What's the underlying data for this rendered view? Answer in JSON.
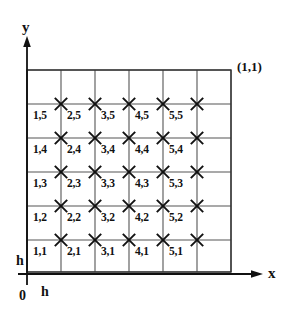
{
  "figure": {
    "title_visible": false,
    "background": "#ffffff",
    "ink_color": "#111111",
    "grid_line_color": "#555555",
    "axes": {
      "x_label": "x",
      "y_label": "y",
      "origin_label": "0"
    },
    "annotations": {
      "top_right_corner": "(1,1)",
      "step_left": "h",
      "step_bottom": "h"
    },
    "geometry": {
      "grid_left": 27,
      "grid_top": 70,
      "grid_right": 231,
      "grid_bottom": 272,
      "cell": 34,
      "vertical_lines_x": [
        27,
        61,
        95,
        129,
        163,
        197,
        231
      ],
      "horizontal_lines_y": [
        70,
        104,
        138,
        172,
        206,
        240,
        272
      ],
      "x_axis_y": 274,
      "y_axis_x": 27,
      "x_axis_end": 262,
      "y_axis_top": 42,
      "y_axis_bottom": 285
    },
    "nodes": {
      "marker_glyph": "cross-marker",
      "marker_x": [
        61,
        95,
        129,
        163,
        197
      ],
      "marker_y": [
        104,
        138,
        172,
        206,
        240
      ],
      "labels": [
        {
          "text": "1,5",
          "x": 33,
          "y": 110,
          "i": 1,
          "j": 5
        },
        {
          "text": "2,5",
          "x": 67,
          "y": 110,
          "i": 2,
          "j": 5
        },
        {
          "text": "3,5",
          "x": 101,
          "y": 110,
          "i": 3,
          "j": 5
        },
        {
          "text": "4,5",
          "x": 135,
          "y": 110,
          "i": 4,
          "j": 5
        },
        {
          "text": "5,5",
          "x": 169,
          "y": 110,
          "i": 5,
          "j": 5
        },
        {
          "text": "1,4",
          "x": 33,
          "y": 144,
          "i": 1,
          "j": 4
        },
        {
          "text": "2,4",
          "x": 67,
          "y": 144,
          "i": 2,
          "j": 4
        },
        {
          "text": "3,4",
          "x": 101,
          "y": 144,
          "i": 3,
          "j": 4
        },
        {
          "text": "4,4",
          "x": 135,
          "y": 144,
          "i": 4,
          "j": 4
        },
        {
          "text": "5,4",
          "x": 169,
          "y": 144,
          "i": 5,
          "j": 4
        },
        {
          "text": "1,3",
          "x": 33,
          "y": 178,
          "i": 1,
          "j": 3
        },
        {
          "text": "2,3",
          "x": 67,
          "y": 178,
          "i": 2,
          "j": 3
        },
        {
          "text": "3,3",
          "x": 101,
          "y": 178,
          "i": 3,
          "j": 3
        },
        {
          "text": "4,3",
          "x": 135,
          "y": 178,
          "i": 4,
          "j": 3
        },
        {
          "text": "5,3",
          "x": 169,
          "y": 178,
          "i": 5,
          "j": 3
        },
        {
          "text": "1,2",
          "x": 33,
          "y": 212,
          "i": 1,
          "j": 2
        },
        {
          "text": "2,2",
          "x": 67,
          "y": 212,
          "i": 2,
          "j": 2
        },
        {
          "text": "3,2",
          "x": 101,
          "y": 212,
          "i": 3,
          "j": 2
        },
        {
          "text": "4,2",
          "x": 135,
          "y": 212,
          "i": 4,
          "j": 2
        },
        {
          "text": "5,2",
          "x": 169,
          "y": 212,
          "i": 5,
          "j": 2
        },
        {
          "text": "1,1",
          "x": 33,
          "y": 246,
          "i": 1,
          "j": 1
        },
        {
          "text": "2,1",
          "x": 67,
          "y": 246,
          "i": 2,
          "j": 1
        },
        {
          "text": "3,1",
          "x": 101,
          "y": 246,
          "i": 3,
          "j": 1
        },
        {
          "text": "4,1",
          "x": 135,
          "y": 246,
          "i": 4,
          "j": 1
        },
        {
          "text": "5,1",
          "x": 169,
          "y": 246,
          "i": 5,
          "j": 1
        }
      ]
    }
  },
  "chart_data": {
    "type": "scatter",
    "title": "",
    "xlabel": "x",
    "ylabel": "y",
    "grid": true,
    "legend": false,
    "xlim": [
      0,
      1
    ],
    "ylim": [
      0,
      1
    ],
    "annotations": [
      "(1,1)",
      "h",
      "h",
      "0"
    ],
    "mesh": {
      "step_label": "h",
      "nx": 5,
      "ny": 5,
      "node_indices_i": [
        1,
        2,
        3,
        4,
        5
      ],
      "node_indices_j": [
        1,
        2,
        3,
        4,
        5
      ],
      "node_labels": [
        [
          "1,1",
          "2,1",
          "3,1",
          "4,1",
          "5,1"
        ],
        [
          "1,2",
          "2,2",
          "3,2",
          "4,2",
          "5,2"
        ],
        [
          "1,3",
          "2,3",
          "3,3",
          "4,3",
          "5,3"
        ],
        [
          "1,4",
          "2,4",
          "3,4",
          "4,4",
          "5,4"
        ],
        [
          "1,5",
          "2,5",
          "3,5",
          "4,5",
          "5,5"
        ]
      ]
    }
  }
}
